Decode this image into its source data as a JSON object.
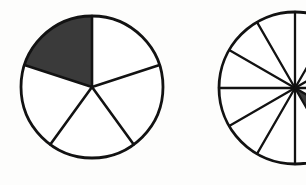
{
  "figure": {
    "background_color": "#fdfdfc",
    "stroke_color": "#121212",
    "shade_color": "#3a3a3a",
    "unshaded_color": "#ffffff",
    "width": 306,
    "height": 185
  },
  "chart_data": {
    "type": "pie",
    "charts": [
      {
        "name": "left-circle",
        "label": "Circle A",
        "center_x": 92,
        "center_y": 87,
        "radius": 71,
        "total_sectors": 5,
        "shaded_sectors": 1,
        "fraction": "1/5",
        "fraction_decimal": 0.2,
        "sector_angle_degrees": 72,
        "start_angle_degrees": -90,
        "direction": "counterclockwise",
        "categories": [
          "1",
          "2",
          "3",
          "4",
          "5"
        ],
        "values": [
          20,
          20,
          20,
          20,
          20
        ],
        "shaded_index": 0,
        "fills": [
          "shaded",
          "unshaded",
          "unshaded",
          "unshaded",
          "unshaded"
        ]
      },
      {
        "name": "right-circle",
        "label": "Circle B",
        "center_x": 295,
        "center_y": 88,
        "radius": 76,
        "total_sectors": 12,
        "shaded_sectors": 1,
        "fraction": "1/12",
        "fraction_decimal": 0.0833,
        "sector_angle_degrees": 30,
        "start_angle_degrees": -90,
        "direction": "counterclockwise",
        "clipped": "right edge of image",
        "categories": [
          "1",
          "2",
          "3",
          "4",
          "5",
          "6",
          "7",
          "8",
          "9",
          "10",
          "11",
          "12"
        ],
        "values": [
          8.33,
          8.33,
          8.33,
          8.33,
          8.33,
          8.33,
          8.33,
          8.33,
          8.33,
          8.33,
          8.33,
          8.33
        ],
        "shaded_index": 7,
        "fills": [
          "unshaded",
          "unshaded",
          "unshaded",
          "unshaded",
          "unshaded",
          "unshaded",
          "unshaded",
          "shaded",
          "unshaded",
          "unshaded",
          "unshaded",
          "unshaded"
        ]
      }
    ],
    "xlabel": "",
    "ylabel": "",
    "legend": [],
    "grid": false
  }
}
